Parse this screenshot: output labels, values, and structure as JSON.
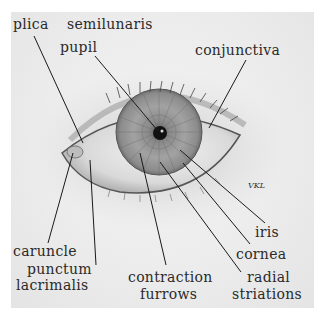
{
  "diagram": {
    "labels": {
      "plica": "plica",
      "semilunaris": "semilunaris",
      "pupil": "pupil",
      "conjunctiva": "conjunctiva",
      "iris": "iris",
      "cornea": "cornea",
      "caruncle": "caruncle",
      "punctum": "punctum",
      "lacrimalis": "lacrimalis",
      "contraction": "contraction",
      "furrows": "furrows",
      "radial": "radial",
      "striations": "striations"
    },
    "signature": "VKL"
  }
}
